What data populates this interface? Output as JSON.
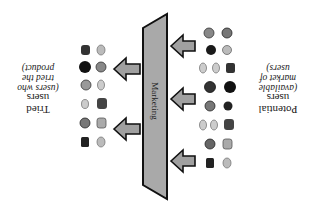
{
  "diagram": {
    "orientation": "rotated 180 degrees",
    "colors": {
      "funnel_fill": "#a9a9a9",
      "arrow_fill": "#a0a0a0",
      "outline": "#111111",
      "face_dark": "#1a1a1a",
      "face_light": "#9a9a9a"
    },
    "funnel": {
      "label": "Marketing"
    },
    "source_group": {
      "title": "Potential",
      "title_line2": "users",
      "subtitle_lines": [
        "(available",
        "market of",
        "users)"
      ],
      "arrow_count": 3,
      "face_count": 20
    },
    "result_group": {
      "title": "Tried",
      "title_line2": "users",
      "subtitle_lines": [
        "(users who",
        "tried the",
        "product)"
      ],
      "arrow_count": 2,
      "face_count": 12
    }
  }
}
